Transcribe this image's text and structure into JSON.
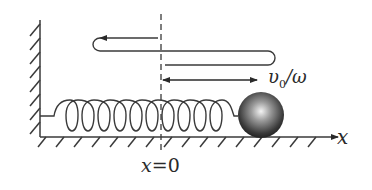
{
  "diagram": {
    "labels": {
      "axis_x": "x",
      "origin_var": "x",
      "origin_eq": "=0",
      "amplitude_v": "υ",
      "amplitude_sub": "0",
      "amplitude_rest": "/ω"
    },
    "elements": [
      "fixed-wall",
      "floor",
      "spring",
      "ball",
      "equilibrium-dashed-line",
      "motion-path",
      "amplitude-arrow",
      "x-axis-arrow"
    ],
    "colors": {
      "line": "#3a3a3a",
      "ball_dark": "#1e1e1e",
      "ball_light": "#f4f4f4",
      "background": "#ffffff"
    }
  }
}
